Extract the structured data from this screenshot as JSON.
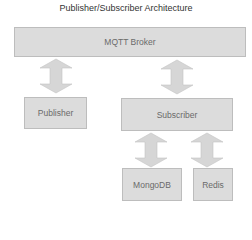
{
  "title": "Publisher/Subscriber Architecture",
  "nodes": {
    "broker": "MQTT Broker",
    "publisher": "Publisher",
    "subscriber": "Subscriber",
    "mongodb": "MongoDB",
    "redis": "Redis"
  },
  "edges": [
    {
      "from": "broker",
      "to": "publisher",
      "type": "bidirectional"
    },
    {
      "from": "broker",
      "to": "subscriber",
      "type": "bidirectional"
    },
    {
      "from": "subscriber",
      "to": "mongodb",
      "type": "bidirectional"
    },
    {
      "from": "subscriber",
      "to": "redis",
      "type": "bidirectional"
    }
  ],
  "colors": {
    "box_fill": "#dcdcdc",
    "box_border": "#bdbdbd",
    "arrow_fill": "#d6d6d6",
    "text": "#6a6a6a"
  }
}
